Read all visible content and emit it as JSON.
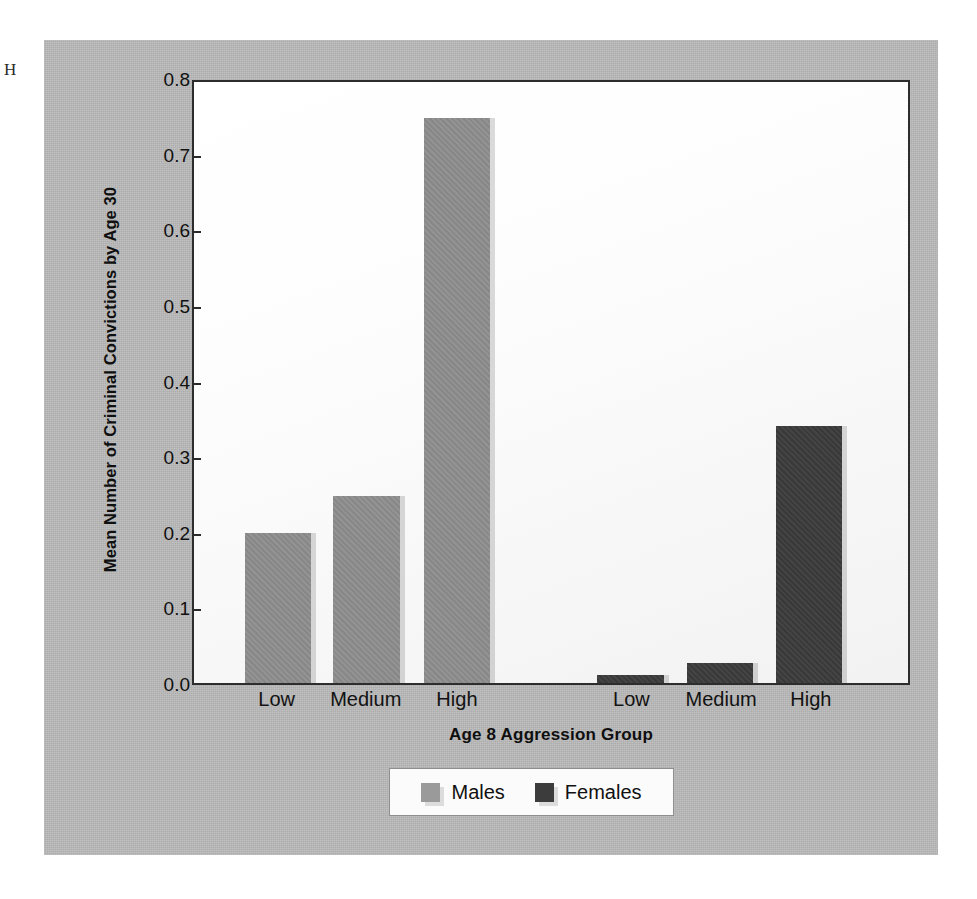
{
  "artifact_text": "H",
  "chart_data": {
    "type": "bar",
    "title": "",
    "xlabel": "Age 8 Aggression Group",
    "ylabel": "Mean Number of Criminal Convictions by Age 30",
    "ylim": [
      0.0,
      0.8
    ],
    "ytick_labels": [
      "0.8",
      "0.7",
      "0.6",
      "0.5",
      "0.4",
      "0.3",
      "0.2",
      "0.1",
      "0.0"
    ],
    "ytick_values": [
      0.8,
      0.7,
      0.6,
      0.5,
      0.4,
      0.3,
      0.2,
      0.1,
      0.0
    ],
    "grid": false,
    "legend_position": "bottom-center",
    "categories": [
      "Low",
      "Medium",
      "High"
    ],
    "series": [
      {
        "name": "Males",
        "color": "#8d8d8d",
        "values": [
          0.2,
          0.249,
          0.752
        ]
      },
      {
        "name": "Females",
        "color": "#3c3c3c",
        "values": [
          0.011,
          0.027,
          0.342
        ]
      }
    ],
    "xtick_labels": [
      "Low",
      "Medium",
      "High",
      "Low",
      "Medium",
      "High"
    ],
    "panel_background": "#b9b9b9",
    "plot_background": "#ffffff",
    "axis_color": "#2d2d2d"
  },
  "bars": [
    {
      "group": "Males",
      "category": "Low",
      "value": 0.2,
      "left_pct": 7.1,
      "width_pct": 9.3
    },
    {
      "group": "Males",
      "category": "Medium",
      "value": 0.249,
      "left_pct": 19.5,
      "width_pct": 9.3
    },
    {
      "group": "Males",
      "category": "High",
      "value": 0.752,
      "left_pct": 32.2,
      "width_pct": 9.3
    },
    {
      "group": "Females",
      "category": "Low",
      "value": 0.011,
      "left_pct": 56.5,
      "width_pct": 9.3
    },
    {
      "group": "Females",
      "category": "Medium",
      "value": 0.027,
      "left_pct": 69.0,
      "width_pct": 9.3
    },
    {
      "group": "Females",
      "category": "High",
      "value": 0.342,
      "left_pct": 81.5,
      "width_pct": 9.3
    }
  ],
  "xticks": [
    {
      "label": "Low",
      "left_pct": 11.8
    },
    {
      "label": "Medium",
      "left_pct": 24.2
    },
    {
      "label": "High",
      "left_pct": 36.9
    },
    {
      "label": "Low",
      "left_pct": 61.2
    },
    {
      "label": "Medium",
      "left_pct": 73.7
    },
    {
      "label": "High",
      "left_pct": 86.2
    }
  ],
  "legend": {
    "entries": [
      {
        "label": "Males",
        "swatch": "males-swatch"
      },
      {
        "label": "Females",
        "swatch": "females-swatch"
      }
    ]
  }
}
